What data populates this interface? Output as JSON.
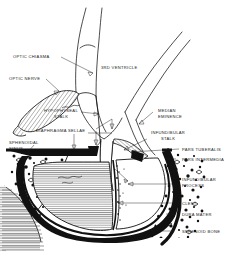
{
  "figure": {
    "type": "anatomical-line-diagram",
    "background_color": "#ffffff",
    "ink_color": "#111111"
  },
  "labels": {
    "optic_chiasma": "OPTIC CHIASMA",
    "optic_nerve": "OPTIC NERVE",
    "third_ventricle": "3RD  VENTRICLE",
    "hypophyseal_stalk_l1": "HYPOPHYSEAL",
    "hypophyseal_stalk_l2": "STALK",
    "median_eminence_l1": "MEDIAN",
    "median_eminence_l2": "EMINENCE",
    "infundibular_stalk_l1": "INFUNDIBULAR",
    "infundibular_stalk_l2": "STALK",
    "diaphragma_sellae": "DIAPHRAGMA SELLAE",
    "sphenoidal_sinus_l1": "SPHENOIDAL",
    "sphenoidal_sinus_l2": "SINUS",
    "pars_tuberalis": "PARS TUBERALIS",
    "pars_intermedia": "PARS INTERMEDIA",
    "infundibular_process_l1": "INFUNDIBULAR",
    "infundibular_process_l2": "PROCESS",
    "cleft": "CLEFT",
    "dura_mater": "DURA MATER",
    "sphenoid_bone": "SPHENOID BONE"
  },
  "structures": {
    "anterior_lobe": "pars-distalis-hatched",
    "posterior_lobe": "infundibular-process",
    "dura": "thick-black-dura-mater-band",
    "bone": "stippled-sphenoid-bone",
    "sinus": "line-hatched-sphenoidal-sinus",
    "optic_nerve_shading": "diagonal-hatch"
  }
}
